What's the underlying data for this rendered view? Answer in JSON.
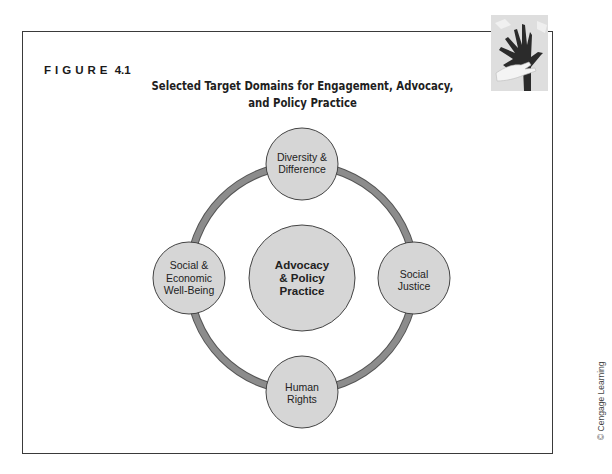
{
  "figure": {
    "label_word": "FIGURE",
    "label_number": "4.1",
    "title_lines": [
      "Selected Target Domains for Engagement, Advocacy,",
      "and Policy Practice"
    ]
  },
  "diagram": {
    "center": {
      "lines": [
        "Advocacy",
        "& Policy",
        "Practice"
      ]
    },
    "nodes": [
      {
        "position": "top",
        "lines": [
          "Diversity &",
          "Difference"
        ]
      },
      {
        "position": "right",
        "lines": [
          "Social",
          "Justice"
        ]
      },
      {
        "position": "bottom",
        "lines": [
          "Human",
          "Rights"
        ]
      },
      {
        "position": "left",
        "lines": [
          "Social &",
          "Economic",
          "Well-Being"
        ]
      }
    ],
    "colors": {
      "node_fill": "#d6d6d6",
      "ring": "#8c8c8c",
      "outline": "#444444"
    }
  },
  "decoration": {
    "icon": "hands-icon"
  },
  "credit": "© Cengage Learning"
}
